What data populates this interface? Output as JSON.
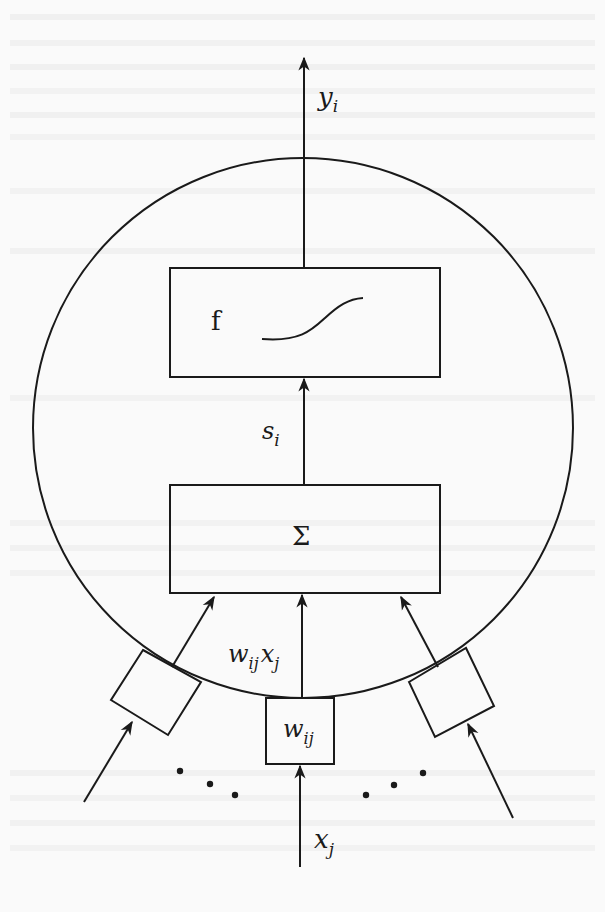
{
  "diagram": {
    "colors": {
      "ink": "#1a1a1a",
      "paper": "#fafafa"
    },
    "labels": {
      "output": {
        "base": "y",
        "sub": "i"
      },
      "activation_box": "f",
      "net_input": {
        "base": "s",
        "sub": "i"
      },
      "sum_box": "Σ",
      "weighted_input": {
        "w": "w",
        "w_sub": "ij",
        "x": "x",
        "x_sub": "j"
      },
      "weight_box": {
        "base": "w",
        "sub": "ij"
      },
      "input": {
        "base": "x",
        "sub": "j"
      }
    },
    "nodes": [
      {
        "id": "neuron",
        "shape": "circle"
      },
      {
        "id": "activation",
        "shape": "rect",
        "label": "f",
        "content": "sigmoid-curve"
      },
      {
        "id": "summation",
        "shape": "rect",
        "label": "Σ"
      },
      {
        "id": "weight-left",
        "shape": "rect-rotated"
      },
      {
        "id": "weight-center",
        "shape": "rect",
        "label": "w_ij"
      },
      {
        "id": "weight-right",
        "shape": "rect-rotated"
      }
    ],
    "edges": [
      {
        "from": "input x_j",
        "to": "weight-center"
      },
      {
        "from": "weight-center",
        "to": "summation",
        "label": "w_ij x_j"
      },
      {
        "from": "left-input",
        "to": "weight-left"
      },
      {
        "from": "weight-left",
        "to": "summation"
      },
      {
        "from": "right-input",
        "to": "weight-right"
      },
      {
        "from": "weight-right",
        "to": "summation"
      },
      {
        "from": "summation",
        "to": "activation",
        "label": "s_i"
      },
      {
        "from": "activation",
        "to": "output",
        "label": "y_i"
      }
    ],
    "ellipsis_groups": 2
  }
}
